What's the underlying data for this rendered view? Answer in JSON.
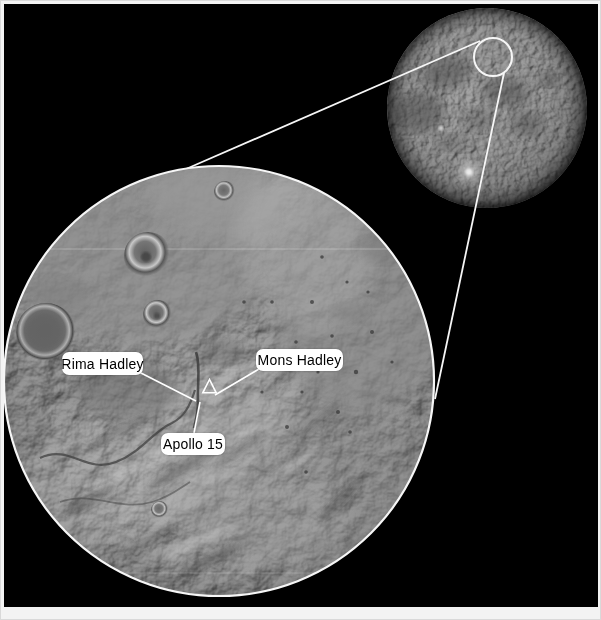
{
  "figure": {
    "colors": {
      "background": "#000000",
      "frame": "#f3f3f3",
      "annotation_line": "#ffffff",
      "label_background": "#ffffff",
      "label_text": "#000000"
    },
    "labels": {
      "rima_hadley": "Rima Hadley",
      "mons_hadley": "Mons Hadley",
      "apollo_15": "Apollo 15"
    },
    "markers": {
      "landing_site": "triangle-marker"
    }
  }
}
